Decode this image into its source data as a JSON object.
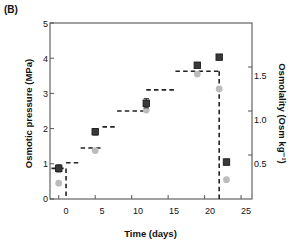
{
  "panel": {
    "label": "(B)"
  },
  "chart_data": {
    "type": "scatter",
    "title": "",
    "xlabel": "Time (days)",
    "ylabel": "Osmotic pressure (MPa)",
    "y2label": "Osmolality (Osm kg⁻¹)",
    "xlim": [
      -1.2,
      26.5
    ],
    "ylim": [
      0,
      5
    ],
    "y2lim": [
      0,
      2.0
    ],
    "grid": false,
    "legend": "none",
    "xticks": [
      0,
      5,
      10,
      15,
      20,
      25
    ],
    "xticklabels": [
      "0",
      "5",
      "10",
      "15",
      "20",
      "25"
    ],
    "yticks": [
      0,
      1,
      2,
      3,
      4,
      5
    ],
    "yticklabels": [
      "0",
      "1",
      "2",
      "3",
      "4",
      "5"
    ],
    "y2ticks": [
      0.5,
      1.0,
      1.5
    ],
    "y2ticklabels": [
      "0.5",
      "1.0",
      "1.5"
    ],
    "series": [
      {
        "name": "Osmotic pressure (MPa)",
        "marker": "square",
        "color": "#3a3a3a",
        "axis": "left",
        "points": [
          {
            "x": 0,
            "y": 0.87,
            "yerr": 0.1
          },
          {
            "x": 5,
            "y": 1.91,
            "yerr": 0.09
          },
          {
            "x": 12,
            "y": 2.72,
            "yerr": 0.13
          },
          {
            "x": 19,
            "y": 3.8,
            "yerr": 0.07
          },
          {
            "x": 22,
            "y": 4.03,
            "yerr": 0.07
          },
          {
            "x": 23,
            "y": 1.05,
            "yerr": 0.08
          }
        ]
      },
      {
        "name": "Osmolality (Osm kg-1)",
        "marker": "circle",
        "color": "#bcbcbc",
        "axis": "right",
        "points": [
          {
            "x": 0,
            "y": 0.18
          },
          {
            "x": 5,
            "y": 0.55
          },
          {
            "x": 12,
            "y": 1.01
          },
          {
            "x": 19,
            "y": 1.42
          },
          {
            "x": 22,
            "y": 1.25
          },
          {
            "x": 23,
            "y": 0.22
          }
        ]
      },
      {
        "name": "Applied step profile",
        "marker": "none",
        "linestyle": "dashed",
        "color": "#222222",
        "axis": "left",
        "steps": [
          {
            "x0": -1.0,
            "x1": 1.0,
            "y": 0.87
          },
          {
            "x0": 1.0,
            "x1": 3.0,
            "y": 1.03
          },
          {
            "x0": 3.0,
            "x1": 6.0,
            "y": 1.45
          },
          {
            "x0": 6.0,
            "x1": 8.0,
            "y": 2.05
          },
          {
            "x0": 8.0,
            "x1": 12.0,
            "y": 2.5
          },
          {
            "x0": 12.0,
            "x1": 16.0,
            "y": 3.1
          },
          {
            "x0": 16.0,
            "x1": 22.0,
            "y": 3.63
          },
          {
            "x0": 22.0,
            "x1": 22.0,
            "y": 0.0
          }
        ],
        "drops": [
          {
            "x": 1.0,
            "y0": 0.87,
            "y1": 0.0
          },
          {
            "x": 22.0,
            "y0": 3.63,
            "y1": 0.0
          }
        ]
      }
    ]
  }
}
